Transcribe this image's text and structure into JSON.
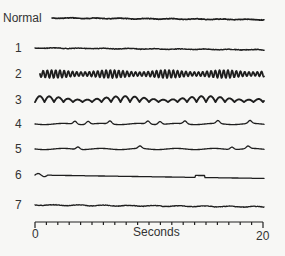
{
  "chart_data": {
    "type": "line",
    "title": "",
    "xlabel": "Seconds",
    "ylabel": "",
    "xlim": [
      0,
      20
    ],
    "x_ticks": {
      "labels": [
        "0",
        "20"
      ],
      "minor_count": 20
    },
    "grid": false,
    "legend": null,
    "series": [
      {
        "name": "Normal",
        "y": 18,
        "amp": 0.8,
        "freq": 3.0,
        "style": "flat",
        "width": 1.6,
        "x0": 52
      },
      {
        "name": "1",
        "y": 48,
        "amp": 0.7,
        "freq": 3.0,
        "style": "flat",
        "width": 1.4,
        "x0": 35
      },
      {
        "name": "2",
        "y": 74,
        "amp": 4.0,
        "freq": 5.0,
        "style": "fast",
        "width": 1.8,
        "x0": 40
      },
      {
        "name": "3",
        "y": 100,
        "amp": 6.0,
        "freq": 1.8,
        "style": "slow",
        "width": 1.9,
        "x0": 35
      },
      {
        "name": "4",
        "y": 124,
        "amp": 3.0,
        "freq": 0.5,
        "style": "spiky",
        "width": 1.3,
        "x0": 35
      },
      {
        "name": "5",
        "y": 149,
        "amp": 2.5,
        "freq": 0.35,
        "style": "spiky",
        "width": 1.3,
        "x0": 35
      },
      {
        "name": "6",
        "y": 175,
        "amp": 1.5,
        "freq": 0.1,
        "style": "drift",
        "width": 1.3,
        "x0": 35
      },
      {
        "name": "7",
        "y": 205,
        "amp": 1.0,
        "freq": 0.2,
        "style": "flat",
        "width": 1.3,
        "x0": 35
      }
    ],
    "axis": {
      "x_start_px": 35,
      "x_end_px": 263,
      "y_px": 222
    }
  },
  "labels": {
    "normal": "Normal",
    "s1": "1",
    "s2": "2",
    "s3": "3",
    "s4": "4",
    "s5": "5",
    "s6": "6",
    "s7": "7",
    "xlabel": "Seconds",
    "x0": "0",
    "x20": "20"
  }
}
